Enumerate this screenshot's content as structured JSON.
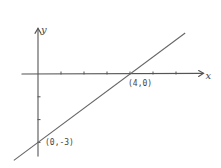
{
  "chart_data": {
    "type": "line",
    "title": "",
    "xlabel": "x",
    "ylabel": "y",
    "xlim": [
      -0.7,
      7.2
    ],
    "ylim": [
      -3.6,
      2.0
    ],
    "grid": false,
    "x_ticks": [
      1,
      2,
      3,
      4,
      5,
      6
    ],
    "y_ticks": [
      -1,
      -2,
      -3
    ],
    "series": [
      {
        "name": "line",
        "equation": "y = 0.75x - 3",
        "x": [
          -1.05,
          6.4
        ],
        "y": [
          -3.79,
          1.8
        ]
      }
    ],
    "annotations": [
      {
        "text": "(4,0)",
        "x": 4,
        "y": 0,
        "position": "below"
      },
      {
        "text": "(0,-3)",
        "x": 0,
        "y": -3,
        "position": "right"
      }
    ]
  }
}
